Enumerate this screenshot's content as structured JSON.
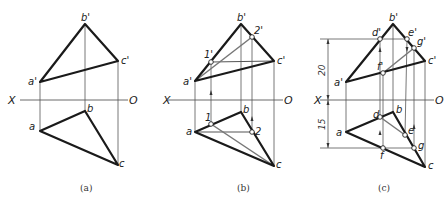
{
  "panels": [
    {
      "id": "a",
      "caption": "(a)",
      "axis": {
        "left_label": "X",
        "right_label": "O"
      },
      "labels": {
        "a_front": "a'",
        "b_front": "b'",
        "c_front": "c'",
        "a_top": "a",
        "b_top": "b",
        "c_top": "c"
      }
    },
    {
      "id": "b",
      "caption": "(b)",
      "axis": {
        "left_label": "X",
        "right_label": "O"
      },
      "labels": {
        "a_front": "a'",
        "b_front": "b'",
        "c_front": "c'",
        "a_top": "a",
        "b_top": "b",
        "c_top": "c",
        "p1_front": "1'",
        "p2_front": "2'",
        "p1_top": "1",
        "p2_top": "2"
      }
    },
    {
      "id": "c",
      "caption": "(c)",
      "axis": {
        "left_label": "X",
        "right_label": "O"
      },
      "labels": {
        "a_front": "a'",
        "b_front": "b'",
        "c_front": "c'",
        "a_top": "a",
        "b_top": "b",
        "c_top": "c",
        "d_front": "d'",
        "e_front": "e'",
        "f_front": "f'",
        "g_front": "g'",
        "d_top": "d",
        "e_top": "e",
        "f_top": "f",
        "g_top": "g"
      },
      "dimensions": {
        "upper": "20",
        "lower": "15"
      }
    }
  ]
}
